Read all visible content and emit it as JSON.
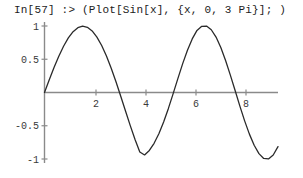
{
  "session": {
    "prompt_label": "In[57]",
    "arrow": ":>",
    "input_expression": "(Plot[Sin[x], {x, 0, 3 Pi}]; )",
    "full_input_line": "In[57] :> (Plot[Sin[x], {x, 0, 3 Pi}]; )"
  },
  "colors": {
    "background": "#ffffff",
    "text": "#1c1c1c",
    "curve": "#2a2a2a",
    "axis": "#8a8a8a",
    "tick_label": "#3a3a3a"
  },
  "chart_data": {
    "type": "line",
    "title": "",
    "subtitle": "",
    "xlabel": "",
    "ylabel": "",
    "function": "Sin[x]",
    "variable": "x",
    "domain_expression": "{x, 0, 3 Pi}",
    "xlim": [
      0,
      9.42477796076938
    ],
    "ylim": [
      -1,
      1
    ],
    "grid": false,
    "legend": null,
    "x_ticks": [
      2,
      4,
      6,
      8
    ],
    "x_tick_labels": [
      "2",
      "4",
      "6",
      "8"
    ],
    "y_ticks": [
      -1,
      -0.5,
      0.5,
      1
    ],
    "y_tick_labels": [
      "-1",
      "-0.5",
      "0.5",
      "1"
    ],
    "series": [
      {
        "name": "Sin[x]",
        "x": [
          0,
          0.19234,
          0.38468,
          0.57702,
          0.76936,
          0.9617,
          1.15404,
          1.34639,
          1.53873,
          1.73107,
          1.92341,
          2.11575,
          2.30809,
          2.50043,
          2.69277,
          2.88511,
          3.07745,
          3.26979,
          3.46213,
          3.65447,
          3.84682,
          4.03916,
          4.2315,
          4.42384,
          4.61618,
          4.80852,
          5.00086,
          5.1932,
          5.38554,
          5.57788,
          5.77022,
          5.96256,
          6.1549,
          6.34725,
          6.53959,
          6.73193,
          6.92427,
          7.11661,
          7.30895,
          7.50129,
          7.69363,
          7.88597,
          8.07831,
          8.27065,
          8.46299,
          8.65533,
          8.84768,
          9.04002,
          9.23236,
          9.42478
        ],
        "y": [
          0,
          0.19116,
          0.37527,
          0.54568,
          0.69605,
          0.82068,
          0.91469,
          0.97421,
          0.99658,
          0.98038,
          0.92555,
          0.83339,
          0.70651,
          0.54878,
          0.36513,
          0.16143,
          -0.05575,
          -0.2783,
          -0.49787,
          -0.70604,
          -0.8947,
          -0.93917,
          -0.87157,
          -0.76394,
          -0.61934,
          -0.44249,
          -0.23936,
          -0.01692,
          0.21218,
          0.43426,
          0.63628,
          0.80608,
          0.93389,
          0.99561,
          0.99919,
          0.94376,
          0.83348,
          0.67599,
          0.48152,
          0.2618,
          0.02915,
          -0.20431,
          -0.42644,
          -0.62591,
          -0.79291,
          -0.91973,
          -0.99124,
          -0.99946,
          -0.9393,
          -0.81389
        ]
      }
    ]
  }
}
